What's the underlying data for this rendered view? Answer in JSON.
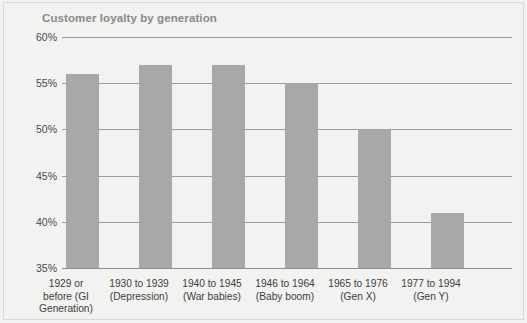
{
  "chart_data": {
    "type": "bar",
    "title": "Customer loyalty by generation",
    "xlabel": "",
    "ylabel": "",
    "ylim": [
      35,
      60
    ],
    "grid": true,
    "legend": "none",
    "yticks": [
      "35%",
      "40%",
      "45%",
      "50%",
      "55%",
      "60%"
    ],
    "ytick_values": [
      35,
      40,
      45,
      50,
      55,
      60
    ],
    "categories": [
      "1929 or before (GI Generation)",
      "1930 to 1939 (Depression)",
      "1940 to 1945 (War babies)",
      "1946 to 1964 (Baby boom)",
      "1965 to 1976 (Gen X)",
      "1977 to 1994 (Gen Y)"
    ],
    "category_lines": [
      [
        "1929 or",
        "before (GI",
        "Generation)"
      ],
      [
        "1930 to 1939",
        "(Depression)"
      ],
      [
        "1940 to 1945",
        "(War babies)"
      ],
      [
        "1946 to 1964",
        "(Baby boom)"
      ],
      [
        "1965 to 1976",
        "(Gen X)"
      ],
      [
        "1977 to 1994",
        "(Gen Y)"
      ]
    ],
    "values": [
      56,
      57,
      57,
      55,
      50,
      41
    ],
    "bar_color": "#a8a8a8",
    "title_color": "#8a8a8a",
    "grid_color": "#9a9a9a",
    "background_color": "#f2f2f0"
  }
}
